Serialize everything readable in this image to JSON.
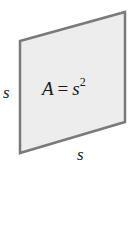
{
  "diagram": {
    "shape": {
      "type": "parallelogram",
      "points": [
        [
          20,
          41
        ],
        [
          125,
          12
        ],
        [
          125,
          122
        ],
        [
          20,
          153
        ]
      ],
      "fill": "#ededed",
      "stroke": "#7a7a7a",
      "stroke_width": 2.5
    },
    "formula": {
      "variable": "A",
      "equals": "=",
      "base": "s",
      "exponent": "2"
    },
    "labels": {
      "left_side": "s",
      "bottom_side": "s"
    }
  }
}
